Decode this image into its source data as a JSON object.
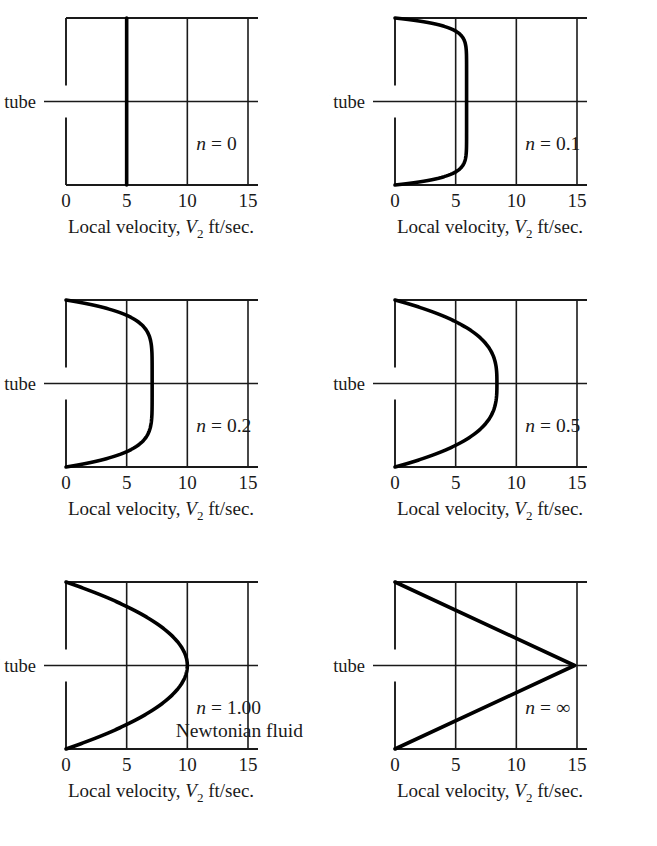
{
  "figure": {
    "kind": "velocity-profile-grid",
    "columns": 2,
    "rows": 3,
    "ink_color": "#1a1a1a",
    "background_color": "#ffffff"
  },
  "axis": {
    "caption_prefix": "Local velocity, ",
    "caption_symbol": "V",
    "caption_subscript": "2",
    "caption_suffix": " ft/sec.",
    "caption_full": "Local velocity, V2 ft/sec.",
    "ticks": [
      "0",
      "5",
      "10",
      "15"
    ],
    "tick_values": [
      0,
      5,
      10,
      15
    ],
    "xlim": [
      0,
      15
    ]
  },
  "centerline": {
    "symbol": "₵",
    "label": "of tube",
    "full": "₵ of tube"
  },
  "panels": [
    {
      "id": "panel-n-0",
      "n_label_prefix": "n",
      "n_label_equals": "= 0",
      "n_label_full": "n = 0",
      "sublabel": "",
      "n_value": 0,
      "v_max": 5.0,
      "shape": "plug"
    },
    {
      "id": "panel-n-0p1",
      "n_label_prefix": "n",
      "n_label_equals": "= 0.1",
      "n_label_full": "n = 0.1",
      "sublabel": "",
      "n_value": 0.1,
      "v_max": 5.9,
      "shape": "power-law"
    },
    {
      "id": "panel-n-0p2",
      "n_label_prefix": "n",
      "n_label_equals": "= 0.2",
      "n_label_full": "n = 0.2",
      "sublabel": "",
      "n_value": 0.2,
      "v_max": 7.1,
      "shape": "power-law"
    },
    {
      "id": "panel-n-0p5",
      "n_label_prefix": "n",
      "n_label_equals": "= 0.5",
      "n_label_full": "n = 0.5",
      "sublabel": "",
      "n_value": 0.5,
      "v_max": 8.4,
      "shape": "power-law"
    },
    {
      "id": "panel-n-1",
      "n_label_prefix": "n",
      "n_label_equals": "= 1.00",
      "n_label_full": "n = 1.00",
      "sublabel": "Newtonian fluid",
      "n_value": 1.0,
      "v_max": 10.0,
      "shape": "power-law"
    },
    {
      "id": "panel-n-inf",
      "n_label_prefix": "n",
      "n_label_equals": "= ∞",
      "n_label_full": "n = ∞",
      "sublabel": "",
      "n_value": null,
      "v_max": 14.8,
      "shape": "triangular"
    }
  ],
  "chart_data": {
    "type": "line",
    "title": "",
    "xlabel": "Local velocity, V2 ft/sec.",
    "ylabel": "Radial position in tube",
    "xlim": [
      0,
      15
    ],
    "ylim": [
      -1,
      1
    ],
    "xticks": [
      0,
      5,
      10,
      15
    ],
    "xticklabels": [
      "0",
      "5",
      "10",
      "15"
    ],
    "grid": true,
    "legend": "none",
    "annotations": [
      "n = 0",
      "n = 0.1",
      "n = 0.2",
      "n = 0.5",
      "n = 1.00",
      "Newtonian fluid",
      "n = ∞",
      "₵ of tube"
    ],
    "series": [
      {
        "name": "n = 0",
        "n": 0,
        "v_max": 5.0,
        "r_over_R": [
          -1,
          -1,
          -0.999,
          -0.5,
          0,
          0.5,
          0.999,
          1,
          1
        ],
        "values": [
          0,
          5.0,
          5.0,
          5.0,
          5.0,
          5.0,
          5.0,
          5.0,
          0
        ]
      },
      {
        "name": "n = 0.1",
        "n": 0.1,
        "v_max": 5.9,
        "r_over_R": [
          -1,
          -0.9,
          -0.8,
          -0.7,
          -0.6,
          -0.5,
          -0.4,
          -0.3,
          -0.2,
          -0.1,
          0,
          0.1,
          0.2,
          0.3,
          0.4,
          0.5,
          0.6,
          0.7,
          0.8,
          0.9,
          1
        ],
        "values": [
          0,
          3.87,
          5.24,
          5.73,
          5.87,
          5.9,
          5.9,
          5.9,
          5.9,
          5.9,
          5.9,
          5.9,
          5.9,
          5.9,
          5.9,
          5.9,
          5.87,
          5.73,
          5.24,
          3.87,
          0
        ]
      },
      {
        "name": "n = 0.2",
        "n": 0.2,
        "v_max": 7.1,
        "r_over_R": [
          -1,
          -0.9,
          -0.8,
          -0.7,
          -0.6,
          -0.5,
          -0.4,
          -0.3,
          -0.2,
          -0.1,
          0,
          0.1,
          0.2,
          0.3,
          0.4,
          0.5,
          0.6,
          0.7,
          0.8,
          0.9,
          1
        ],
        "values": [
          0,
          3.58,
          5.91,
          6.88,
          7.07,
          7.1,
          7.1,
          7.1,
          7.1,
          7.1,
          7.1,
          7.1,
          7.1,
          7.1,
          7.1,
          7.1,
          7.07,
          6.88,
          5.91,
          3.58,
          0
        ]
      },
      {
        "name": "n = 0.5",
        "n": 0.5,
        "v_max": 8.4,
        "r_over_R": [
          -1,
          -0.9,
          -0.8,
          -0.7,
          -0.6,
          -0.5,
          -0.4,
          -0.3,
          -0.2,
          -0.1,
          0,
          0.1,
          0.2,
          0.3,
          0.4,
          0.5,
          0.6,
          0.7,
          0.8,
          0.9,
          1
        ],
        "values": [
          0,
          2.28,
          4.1,
          5.52,
          6.58,
          7.35,
          7.86,
          8.17,
          8.33,
          8.39,
          8.4,
          8.39,
          8.33,
          8.17,
          7.86,
          7.35,
          6.58,
          5.52,
          4.1,
          2.28,
          0
        ]
      },
      {
        "name": "n = 1.00",
        "n": 1.0,
        "v_max": 10.0,
        "r_over_R": [
          -1,
          -0.9,
          -0.8,
          -0.7,
          -0.6,
          -0.5,
          -0.4,
          -0.3,
          -0.2,
          -0.1,
          0,
          0.1,
          0.2,
          0.3,
          0.4,
          0.5,
          0.6,
          0.7,
          0.8,
          0.9,
          1
        ],
        "values": [
          0,
          1.9,
          3.6,
          5.1,
          6.4,
          7.5,
          8.4,
          9.1,
          9.6,
          9.9,
          10.0,
          9.9,
          9.6,
          9.1,
          8.4,
          7.5,
          6.4,
          5.1,
          3.6,
          1.9,
          0
        ]
      },
      {
        "name": "n = ∞",
        "n": null,
        "v_max": 14.8,
        "r_over_R": [
          -1,
          -0.75,
          -0.5,
          -0.25,
          0,
          0.25,
          0.5,
          0.75,
          1
        ],
        "values": [
          0,
          3.7,
          7.4,
          11.1,
          14.8,
          11.1,
          7.4,
          3.7,
          0
        ]
      }
    ]
  }
}
